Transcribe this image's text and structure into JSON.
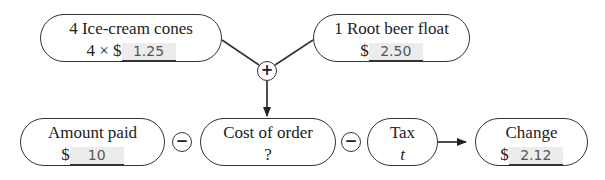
{
  "diagram": {
    "top_left": {
      "title": "4 Ice-cream cones",
      "prefix": "4 × $",
      "value": "1.25"
    },
    "top_right": {
      "title": "1 Root beer float",
      "prefix": "$",
      "value": "2.50"
    },
    "plus_op": "+",
    "amount_paid": {
      "title": "Amount paid",
      "prefix": "$",
      "value": "10"
    },
    "minus_op_1": "−",
    "cost_of_order": {
      "title": "Cost of order",
      "value": "?"
    },
    "minus_op_2": "−",
    "tax": {
      "title": "Tax",
      "value": "t"
    },
    "change": {
      "title": "Change",
      "prefix": "$",
      "value": "2.12"
    }
  }
}
